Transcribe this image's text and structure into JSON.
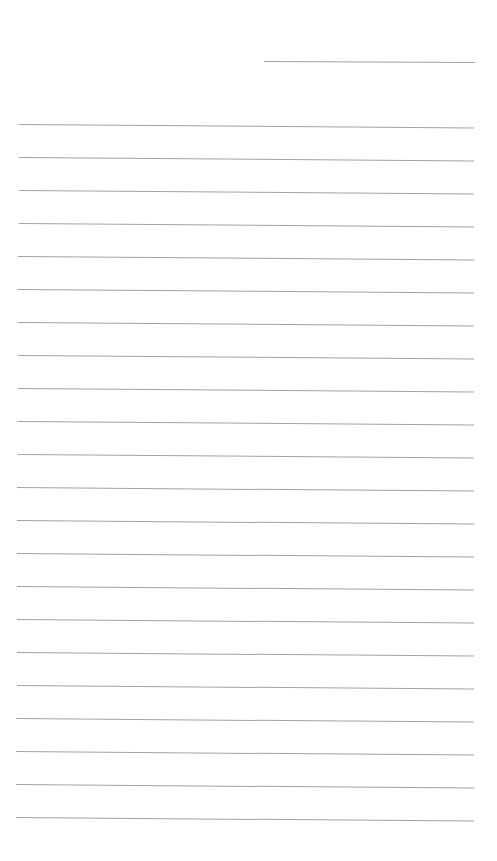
{
  "document": {
    "type": "lined-paper",
    "background_color": "#ffffff",
    "line_color": "#a2a2a2",
    "header_line": {
      "x": 264,
      "y": 61,
      "width": 211
    },
    "ruled_lines": {
      "count": 22,
      "first_y": 124,
      "spacing": 33,
      "left_x_top": 19,
      "left_x_bottom": 16,
      "right_x": 474,
      "tilt_deg": 0.45
    }
  }
}
